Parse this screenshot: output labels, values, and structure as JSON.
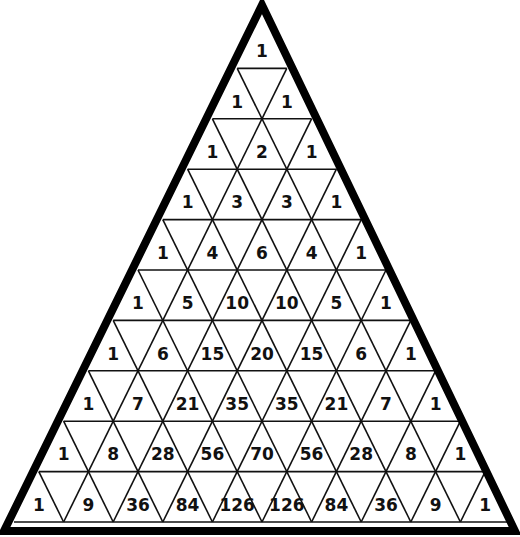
{
  "diagram": {
    "rows_count": 10,
    "colors": {
      "line": "#111111",
      "border": "#000000",
      "background": "#ffffff",
      "text": "#111111"
    },
    "geometry": {
      "outer": {
        "apex": [
          262,
          5
        ],
        "left": [
          4,
          531
        ],
        "right": [
          515,
          531
        ],
        "stroke": 8
      },
      "inner": {
        "apex_y": 18,
        "base_y": 522,
        "base_left_x": 14,
        "base_right_x": 510,
        "center_x": 262
      }
    },
    "rows": [
      [
        1
      ],
      [
        1,
        1
      ],
      [
        1,
        2,
        1
      ],
      [
        1,
        3,
        3,
        1
      ],
      [
        1,
        4,
        6,
        4,
        1
      ],
      [
        1,
        5,
        10,
        10,
        5,
        1
      ],
      [
        1,
        6,
        15,
        20,
        15,
        6,
        1
      ],
      [
        1,
        7,
        21,
        35,
        35,
        21,
        7,
        1
      ],
      [
        1,
        8,
        28,
        56,
        70,
        56,
        28,
        8,
        1
      ],
      [
        1,
        9,
        36,
        84,
        126,
        126,
        84,
        36,
        9,
        1
      ]
    ]
  }
}
